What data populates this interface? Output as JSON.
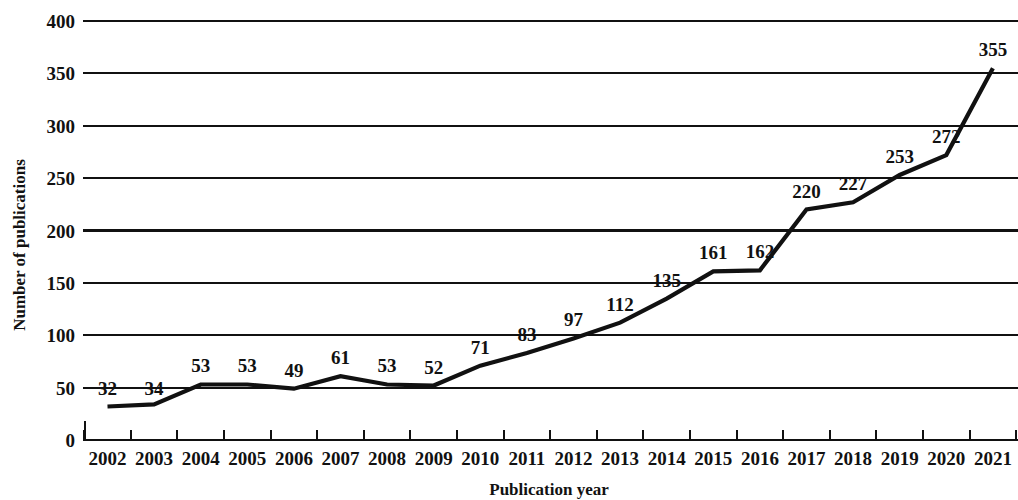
{
  "chart_data": {
    "type": "line",
    "title": "",
    "xlabel": "Publication year",
    "ylabel": "Number of publications",
    "categories": [
      "2002",
      "2003",
      "2004",
      "2005",
      "2006",
      "2007",
      "2008",
      "2009",
      "2010",
      "2011",
      "2012",
      "2013",
      "2014",
      "2015",
      "2016",
      "2017",
      "2018",
      "2019",
      "2020",
      "2021"
    ],
    "values": [
      32,
      34,
      53,
      53,
      49,
      61,
      53,
      52,
      71,
      83,
      97,
      112,
      135,
      161,
      162,
      220,
      227,
      253,
      272,
      355
    ],
    "series": [
      {
        "name": "Number of publications",
        "values": [
          32,
          34,
          53,
          53,
          49,
          61,
          53,
          52,
          71,
          83,
          97,
          112,
          135,
          161,
          162,
          220,
          227,
          253,
          272,
          355
        ]
      }
    ],
    "ylim": [
      0,
      400
    ],
    "ytick_labels": [
      "0",
      "50",
      "100",
      "150",
      "200",
      "250",
      "300",
      "350",
      "400"
    ],
    "ytick_values": [
      0,
      50,
      100,
      150,
      200,
      250,
      300,
      350,
      400
    ],
    "xtick_labels": [
      "2002",
      "2003",
      "2004",
      "2005",
      "2006",
      "2007",
      "2008",
      "2009",
      "2010",
      "2011",
      "2012",
      "2013",
      "2014",
      "2015",
      "2016",
      "2017",
      "2018",
      "2019",
      "2020",
      "2021"
    ],
    "point_labels": [
      "32",
      "34",
      "53",
      "53",
      "49",
      "61",
      "53",
      "52",
      "71",
      "83",
      "97",
      "112",
      "135",
      "161",
      "162",
      "220",
      "227",
      "253",
      "272",
      "355"
    ],
    "grid": "horizontal",
    "legend": "none",
    "line_color": "#111111",
    "background_color": "#ffffff"
  }
}
